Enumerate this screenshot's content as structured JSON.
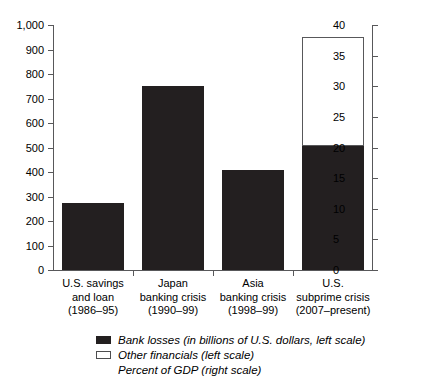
{
  "chart_data": {
    "type": "bar",
    "title": "",
    "subtitle": "",
    "xlabel": "",
    "ylabel": "",
    "grid": false,
    "legend_position": "bottom-left",
    "categories": [
      "U.S. savings and loan (1986–95)",
      "Japan banking crisis (1990–99)",
      "Asia banking crisis (1998–99)",
      "U.S. subprime crisis (2007–present)"
    ],
    "category_lines": [
      [
        "U.S. savings",
        "and loan",
        "(1986–95)"
      ],
      [
        "Japan",
        "banking crisis",
        "(1990–99)"
      ],
      [
        "Asia",
        "banking crisis",
        "(1998–99)"
      ],
      [
        "U.S.",
        "subprime crisis",
        "(2007–present)"
      ]
    ],
    "series": [
      {
        "name": "Bank losses (in billions of U.S. dollars, left scale)",
        "axis": "left",
        "color": "#231f20",
        "values": [
          275,
          750,
          410,
          505
        ]
      },
      {
        "name": "Other financials (left scale)",
        "axis": "left",
        "color": "#ffffff",
        "values": [
          0,
          0,
          0,
          445
        ]
      }
    ],
    "totals": [
      275,
      750,
      410,
      950
    ],
    "left_axis": {
      "label": "",
      "min": 0,
      "max": 1000,
      "step": 100,
      "ticks": [
        0,
        100,
        200,
        300,
        400,
        500,
        600,
        700,
        800,
        900,
        1000
      ],
      "tick_labels": [
        "0",
        "100",
        "200",
        "300",
        "400",
        "500",
        "600",
        "700",
        "800",
        "900",
        "1,000"
      ]
    },
    "right_axis": {
      "label": "Percent of GDP (right scale)",
      "min": 0,
      "max": 40,
      "step": 5,
      "ticks": [
        0,
        5,
        10,
        15,
        20,
        25,
        30,
        35,
        40
      ],
      "tick_labels": [
        "0",
        "5",
        "10",
        "15",
        "20",
        "25",
        "30",
        "35",
        "40"
      ]
    },
    "legend": [
      {
        "label": "Bank losses (in billions of U.S. dollars, left scale)",
        "swatch": "filled",
        "color": "#231f20"
      },
      {
        "label": "Other financials (left scale)",
        "swatch": "open",
        "color": "#ffffff"
      },
      {
        "label": "Percent of GDP (right scale)",
        "swatch": "none",
        "color": ""
      }
    ]
  }
}
